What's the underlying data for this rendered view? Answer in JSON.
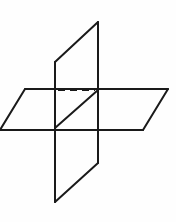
{
  "figure": {
    "canvas": {
      "width": 176,
      "height": 222
    },
    "background_color": "#fefefe",
    "stroke_color": "#1a1a1a",
    "stroke_width": 2.0,
    "hidden_stroke_width": 2.0,
    "hidden_dash_pattern": "7 5",
    "face_fill": "none"
  },
  "geometry": {
    "vertical_plane": {
      "name": "vertical-plane",
      "label": "Vertical plane",
      "outline_points": "98,22 55,62 55,202 98,163",
      "upper_left_top": "55,62",
      "upper_right_top": "98,22",
      "lower_left_bottom": "55,202",
      "lower_right_bottom": "98,163",
      "segments": {
        "top_slant": "55,62 98,22",
        "bottom_slant": "55,202 98,163",
        "left_edge_upper": "55,62 55,128",
        "left_edge_lower": "55,128 55,202",
        "right_edge_upper": "98,22 98,90",
        "right_edge_lower": "98,90 98,163"
      }
    },
    "horizontal_plane": {
      "name": "horizontal-plane",
      "label": "Horizontal plane",
      "outline_points": "25,89 168,89 143,130 0,130",
      "top_edge": "25,89 168,89",
      "bottom_edge": "0,130 143,130",
      "left_slant": "25,89 0,130",
      "right_slant": "168,89 143,130"
    },
    "intersection_line": {
      "name": "line-of-intersection",
      "label": "Line of intersection",
      "visible_segment": "55,128 98,90",
      "hidden_horizontal_segment": "58,90 95,90",
      "hidden_vertical_segment": "98,93 98,127",
      "style_visible": "solid",
      "style_hidden": "dashed"
    },
    "vertices": [
      {
        "name": "vertex-top-right",
        "x": 98,
        "y": 22
      },
      {
        "name": "vertex-top-left",
        "x": 55,
        "y": 62
      },
      {
        "name": "vertex-plane-top-left",
        "x": 25,
        "y": 89
      },
      {
        "name": "vertex-plane-top-right",
        "x": 168,
        "y": 89
      },
      {
        "name": "vertex-intersection-upper",
        "x": 98,
        "y": 90
      },
      {
        "name": "vertex-intersection-lower",
        "x": 55,
        "y": 128
      },
      {
        "name": "vertex-plane-bottom-left",
        "x": 0,
        "y": 130
      },
      {
        "name": "vertex-plane-bottom-right",
        "x": 143,
        "y": 130
      },
      {
        "name": "vertex-bottom-right",
        "x": 98,
        "y": 163
      },
      {
        "name": "vertex-bottom-left",
        "x": 55,
        "y": 202
      }
    ]
  }
}
